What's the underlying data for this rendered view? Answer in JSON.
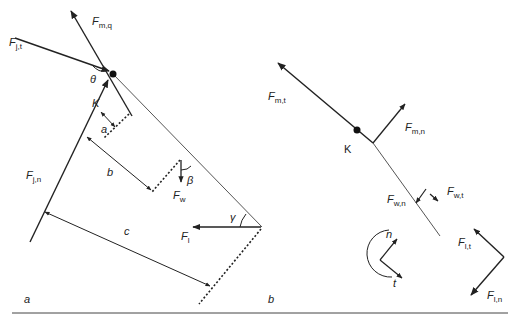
{
  "figure": {
    "panels": [
      {
        "id": "a",
        "label": "a",
        "point_label": "K",
        "forces": [
          {
            "symbol": "F",
            "subscript": "j,t"
          },
          {
            "symbol": "F",
            "subscript": "m,q"
          },
          {
            "symbol": "F",
            "subscript": "j,n"
          },
          {
            "symbol": "F",
            "subscript": "w"
          },
          {
            "symbol": "F",
            "subscript": "l"
          }
        ],
        "distances": [
          "a",
          "b",
          "c"
        ],
        "angles": [
          "θ",
          "β",
          "γ"
        ]
      },
      {
        "id": "b",
        "label": "b",
        "point_label": "K",
        "forces": [
          {
            "symbol": "F",
            "subscript": "m,t"
          },
          {
            "symbol": "F",
            "subscript": "m,n"
          },
          {
            "symbol": "F",
            "subscript": "w,n"
          },
          {
            "symbol": "F",
            "subscript": "w,t"
          },
          {
            "symbol": "F",
            "subscript": "l,t"
          },
          {
            "symbol": "F",
            "subscript": "l,n"
          }
        ],
        "axes_legend": {
          "normal": "n",
          "tangential": "t"
        }
      }
    ],
    "labels": {
      "F": "F",
      "Fjt_sub": "j,t",
      "Fmq_sub": "m,q",
      "Fjn_sub": "j,n",
      "Fw_sub": "w",
      "Fl_sub": "l",
      "Fmt_sub": "m,t",
      "Fmn_sub": "m,n",
      "Fwn_sub": "w,n",
      "Fwt_sub": "w,t",
      "Flt_sub": "l,t",
      "Fln_sub": "l,n",
      "K_a": "K",
      "K_b": "K",
      "dist_a": "a",
      "dist_b": "b",
      "dist_c": "c",
      "theta": "θ",
      "beta": "β",
      "gamma": "γ",
      "panel_a": "a",
      "panel_b": "b",
      "axis_n": "n",
      "axis_t": "t"
    },
    "colors": {
      "line": "#222222",
      "thin_line": "#555555",
      "background": "#ffffff"
    }
  }
}
